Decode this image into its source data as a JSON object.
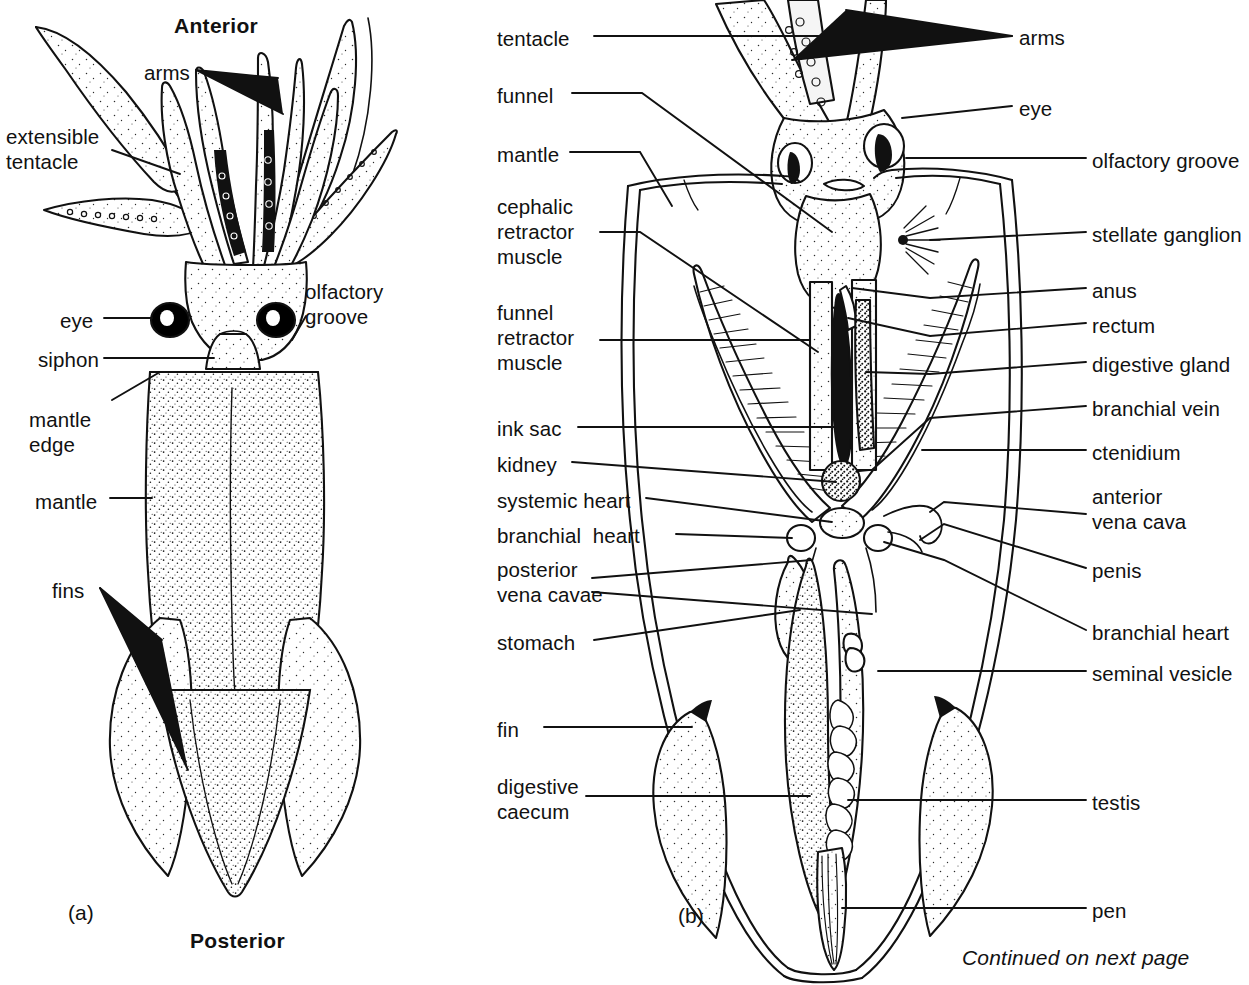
{
  "figure": {
    "background_color": "#ffffff",
    "ink_color": "#111111",
    "footer_note": "Continued on next page"
  },
  "panel_a": {
    "key": "(a)",
    "orientation_top": "Anterior",
    "orientation_bottom": "Posterior",
    "labels": [
      {
        "id": "arms",
        "text": "arms"
      },
      {
        "id": "extensible-tentacle",
        "text": "extensible\ntentacle"
      },
      {
        "id": "eye",
        "text": "eye"
      },
      {
        "id": "olfactory-groove",
        "text": "olfactory\ngroove"
      },
      {
        "id": "siphon",
        "text": "siphon"
      },
      {
        "id": "mantle-edge",
        "text": "mantle\nedge"
      },
      {
        "id": "mantle",
        "text": "mantle"
      },
      {
        "id": "fins",
        "text": "fins"
      }
    ]
  },
  "panel_b": {
    "key": "(b)",
    "labels_left": [
      {
        "id": "tentacle",
        "text": "tentacle"
      },
      {
        "id": "funnel",
        "text": "funnel"
      },
      {
        "id": "mantle",
        "text": "mantle"
      },
      {
        "id": "cephalic-retractor-muscle",
        "text": "cephalic\nretractor\nmuscle"
      },
      {
        "id": "funnel-retractor-muscle",
        "text": "funnel\nretractor\nmuscle"
      },
      {
        "id": "ink-sac",
        "text": "ink sac"
      },
      {
        "id": "kidney",
        "text": "kidney"
      },
      {
        "id": "systemic-heart",
        "text": "systemic heart"
      },
      {
        "id": "branchial-heart",
        "text": "branchial  heart"
      },
      {
        "id": "posterior-vena-cavae",
        "text": "posterior\nvena cavae"
      },
      {
        "id": "stomach",
        "text": "stomach"
      },
      {
        "id": "fin",
        "text": "fin"
      },
      {
        "id": "digestive-caecum",
        "text": "digestive\ncaecum"
      }
    ],
    "labels_right": [
      {
        "id": "arms",
        "text": "arms"
      },
      {
        "id": "eye",
        "text": "eye"
      },
      {
        "id": "olfactory-groove",
        "text": "olfactory groove"
      },
      {
        "id": "stellate-ganglion",
        "text": "stellate ganglion"
      },
      {
        "id": "anus",
        "text": "anus"
      },
      {
        "id": "rectum",
        "text": "rectum"
      },
      {
        "id": "digestive-gland",
        "text": "digestive gland"
      },
      {
        "id": "branchial-vein",
        "text": "branchial vein"
      },
      {
        "id": "ctenidium",
        "text": "ctenidium"
      },
      {
        "id": "anterior-vena-cava",
        "text": "anterior\nvena cava"
      },
      {
        "id": "penis",
        "text": "penis"
      },
      {
        "id": "branchial-heart",
        "text": "branchial heart"
      },
      {
        "id": "seminal-vesicle",
        "text": "seminal vesicle"
      },
      {
        "id": "testis",
        "text": "testis"
      },
      {
        "id": "pen",
        "text": "pen"
      }
    ]
  }
}
